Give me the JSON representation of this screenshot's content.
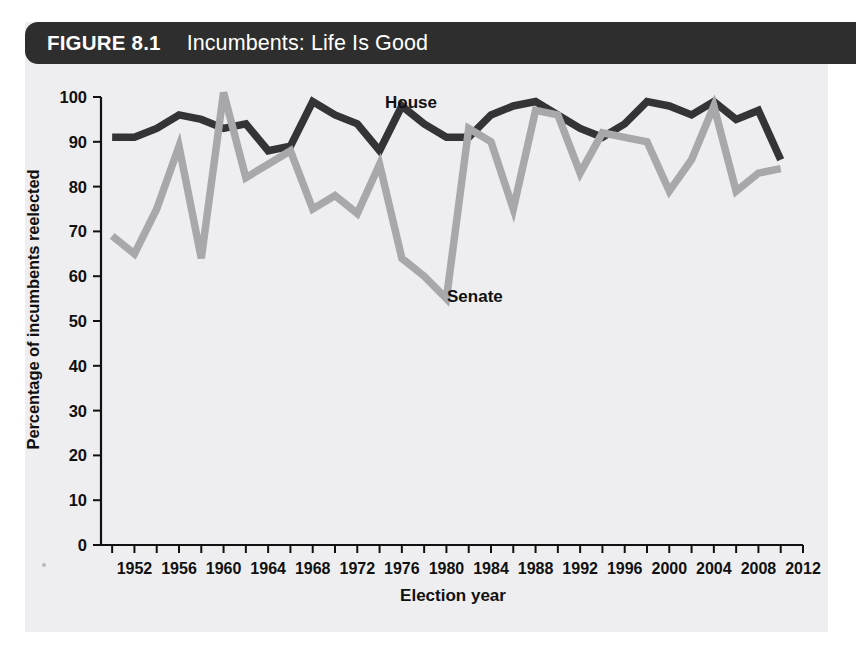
{
  "figure": {
    "number_label": "FIGURE 8.1",
    "title": "Incumbents: Life Is Good"
  },
  "chart_data": {
    "type": "line",
    "title": "Incumbents: Life Is Good",
    "xlabel": "Election year",
    "ylabel": "Percentage of incumbents reelected",
    "xlim": [
      1949,
      2012
    ],
    "ylim": [
      0,
      100
    ],
    "grid": false,
    "legend_position": "inline-annotations",
    "x_tick_labels": [
      "1952",
      "1956",
      "1960",
      "1964",
      "1968",
      "1972",
      "1976",
      "1980",
      "1984",
      "1988",
      "1992",
      "1996",
      "2000",
      "2004",
      "2008",
      "2012"
    ],
    "x_tick_values": [
      1952,
      1956,
      1960,
      1964,
      1968,
      1972,
      1976,
      1980,
      1984,
      1988,
      1992,
      1996,
      2000,
      2004,
      2008,
      2012
    ],
    "x_minor_tick_values": [
      1950,
      1952,
      1954,
      1956,
      1958,
      1960,
      1962,
      1964,
      1966,
      1968,
      1970,
      1972,
      1974,
      1976,
      1978,
      1980,
      1982,
      1984,
      1986,
      1988,
      1990,
      1992,
      1994,
      1996,
      1998,
      2000,
      2002,
      2004,
      2006,
      2008,
      2010,
      2012
    ],
    "y_tick_labels": [
      "0",
      "10",
      "20",
      "30",
      "40",
      "50",
      "60",
      "70",
      "80",
      "90",
      "100"
    ],
    "y_tick_values": [
      0,
      10,
      20,
      30,
      40,
      50,
      60,
      70,
      80,
      90,
      100
    ],
    "x": [
      1950,
      1952,
      1954,
      1956,
      1958,
      1960,
      1962,
      1964,
      1966,
      1968,
      1970,
      1972,
      1974,
      1976,
      1978,
      1980,
      1982,
      1984,
      1986,
      1988,
      1990,
      1992,
      1994,
      1996,
      1998,
      2000,
      2002,
      2004,
      2006,
      2008,
      2010
    ],
    "series": [
      {
        "name": "House",
        "color": "#333338",
        "label_text": "House",
        "values": [
          91,
          91,
          93,
          96,
          95,
          93,
          94,
          88,
          89,
          99,
          96,
          94,
          88,
          98,
          94,
          91,
          91,
          96,
          98,
          99,
          96,
          93,
          91,
          94,
          99,
          98,
          96,
          99,
          95,
          97,
          86
        ]
      },
      {
        "name": "Senate",
        "color": "#a8a8ac",
        "label_text": "Senate",
        "values": [
          69,
          65,
          75,
          89,
          64,
          101,
          82,
          85,
          88,
          75,
          78,
          74,
          85,
          64,
          60,
          55,
          93,
          90,
          75,
          97,
          96,
          83,
          92,
          91,
          90,
          79,
          86,
          98,
          79,
          83,
          84
        ]
      }
    ],
    "annotations": [
      {
        "text": "House",
        "x_px": 385,
        "y_px": 108
      },
      {
        "text": "Senate",
        "x_px": 447,
        "y_px": 302
      }
    ]
  },
  "axes_geometry": {
    "plot_left_px": 101,
    "plot_right_px": 803,
    "plot_top_px": 97,
    "plot_bottom_px": 545
  }
}
